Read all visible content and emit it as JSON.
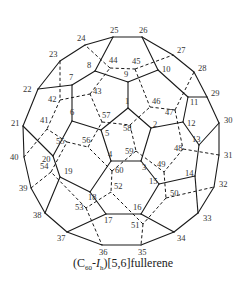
{
  "title": "(C60-Ih)[5,6]fullerene",
  "caption": {
    "prefix": "(C",
    "sub1": "60",
    "dash": "-",
    "italic": "I",
    "sub2": "h",
    "suffix": ")[5,6]fullerene"
  },
  "colors": {
    "stroke": "#1a1a1a",
    "label": "#333333",
    "background": "#ffffff"
  },
  "nodes": {
    "1": [
      128,
      108
    ],
    "2": [
      151,
      128
    ],
    "3": [
      141,
      161
    ],
    "4": [
      111,
      161
    ],
    "5": [
      101,
      130
    ],
    "6": [
      72,
      121
    ],
    "7": [
      72,
      85
    ],
    "8": [
      95,
      71
    ],
    "9": [
      128,
      82
    ],
    "10": [
      158,
      70
    ],
    "11": [
      188,
      97
    ],
    "12": [
      183,
      122
    ],
    "13": [
      199,
      145
    ],
    "14": [
      195,
      176
    ],
    "15": [
      159,
      184
    ],
    "16": [
      141,
      214
    ],
    "17": [
      106,
      214
    ],
    "18": [
      90,
      192
    ],
    "19": [
      60,
      177
    ],
    "20": [
      53,
      156
    ],
    "21": [
      23,
      126
    ],
    "22": [
      38,
      89
    ],
    "23": [
      60,
      61
    ],
    "24": [
      85,
      45
    ],
    "25": [
      113,
      37
    ],
    "26": [
      142,
      37
    ],
    "27": [
      173,
      55
    ],
    "28": [
      194,
      72
    ],
    "29": [
      207,
      97
    ],
    "30": [
      219,
      123
    ],
    "31": [
      219,
      155
    ],
    "32": [
      214,
      187
    ],
    "33": [
      198,
      213
    ],
    "34": [
      174,
      232
    ],
    "35": [
      141,
      245
    ],
    "36": [
      102,
      245
    ],
    "37": [
      67,
      232
    ],
    "38": [
      45,
      213
    ],
    "39": [
      31,
      188
    ],
    "40": [
      24,
      157
    ],
    "41": [
      47,
      129
    ],
    "42": [
      60,
      100
    ],
    "43": [
      90,
      94
    ],
    "44": [
      110,
      68
    ],
    "45": [
      135,
      69
    ],
    "46": [
      150,
      107
    ],
    "47": [
      175,
      110
    ],
    "48": [
      183,
      149
    ],
    "49": [
      164,
      172
    ],
    "50": [
      166,
      198
    ],
    "51": [
      143,
      224
    ],
    "52": [
      111,
      192
    ],
    "53": [
      86,
      208
    ],
    "54": [
      51,
      172
    ],
    "55": [
      67,
      142
    ],
    "56": [
      88,
      147
    ],
    "57": [
      102,
      122
    ],
    "58": [
      130,
      125
    ],
    "59": [
      136,
      151
    ],
    "60": [
      112,
      171
    ]
  },
  "label_offsets": {
    "1": [
      -3,
      -4
    ],
    "2": [
      2,
      -1
    ],
    "3": [
      1,
      9
    ],
    "4": [
      -3,
      -4
    ],
    "5": [
      4,
      6
    ],
    "6": [
      -2,
      -6
    ],
    "7": [
      -3,
      -5
    ],
    "8": [
      -8,
      -3
    ],
    "9": [
      -4,
      -5
    ],
    "10": [
      4,
      2
    ],
    "11": [
      2,
      8
    ],
    "12": [
      4,
      4
    ],
    "13": [
      -7,
      -3
    ],
    "14": [
      -10,
      0
    ],
    "15": [
      -10,
      0
    ],
    "16": [
      -8,
      -4
    ],
    "17": [
      -2,
      9
    ],
    "18": [
      -2,
      8
    ],
    "19": [
      4,
      -3
    ],
    "20": [
      -11,
      6
    ],
    "21": [
      -12,
      0
    ],
    "22": [
      -15,
      3
    ],
    "23": [
      -11,
      -4
    ],
    "24": [
      -8,
      -4
    ],
    "25": [
      -3,
      -4
    ],
    "26": [
      -3,
      -4
    ],
    "27": [
      4,
      -2
    ],
    "28": [
      4,
      -1
    ],
    "29": [
      4,
      -1
    ],
    "30": [
      5,
      0
    ],
    "31": [
      5,
      3
    ],
    "32": [
      5,
      0
    ],
    "33": [
      5,
      8
    ],
    "34": [
      3,
      9
    ],
    "35": [
      -3,
      10
    ],
    "36": [
      -3,
      10
    ],
    "37": [
      -10,
      9
    ],
    "38": [
      -12,
      5
    ],
    "39": [
      -12,
      3
    ],
    "40": [
      -14,
      3
    ],
    "41": [
      -7,
      -6
    ],
    "42": [
      -12,
      2
    ],
    "43": [
      3,
      0
    ],
    "44": [
      -1,
      -5
    ],
    "45": [
      -3,
      -5
    ],
    "46": [
      2,
      -3
    ],
    "47": [
      -10,
      5
    ],
    "48": [
      -9,
      2
    ],
    "49": [
      -7,
      -5
    ],
    "50": [
      4,
      -2
    ],
    "51": [
      -12,
      4
    ],
    "52": [
      3,
      -3
    ],
    "53": [
      -11,
      2
    ],
    "54": [
      -11,
      -3
    ],
    "55": [
      -11,
      2
    ],
    "56": [
      -6,
      -4
    ],
    "57": [
      0,
      -4
    ],
    "58": [
      -7,
      6
    ],
    "59": [
      -11,
      3
    ],
    "60": [
      3,
      2
    ]
  },
  "solid_edges": [
    [
      21,
      22
    ],
    [
      22,
      23
    ],
    [
      23,
      24
    ],
    [
      24,
      25
    ],
    [
      25,
      26
    ],
    [
      26,
      27
    ],
    [
      27,
      28
    ],
    [
      28,
      29
    ],
    [
      29,
      30
    ],
    [
      30,
      31
    ],
    [
      31,
      32
    ],
    [
      32,
      33
    ],
    [
      33,
      34
    ],
    [
      34,
      35
    ],
    [
      35,
      36
    ],
    [
      36,
      37
    ],
    [
      37,
      38
    ],
    [
      38,
      39
    ],
    [
      39,
      40
    ],
    [
      40,
      21
    ],
    [
      22,
      7
    ],
    [
      7,
      8
    ],
    [
      8,
      25
    ],
    [
      8,
      9
    ],
    [
      9,
      10
    ],
    [
      10,
      26
    ],
    [
      10,
      11
    ],
    [
      11,
      29
    ],
    [
      11,
      12
    ],
    [
      12,
      13
    ],
    [
      13,
      30
    ],
    [
      13,
      14
    ],
    [
      14,
      33
    ],
    [
      14,
      15
    ],
    [
      15,
      16
    ],
    [
      16,
      34
    ],
    [
      16,
      17
    ],
    [
      17,
      37
    ],
    [
      17,
      18
    ],
    [
      18,
      19
    ],
    [
      19,
      38
    ],
    [
      19,
      20
    ],
    [
      20,
      21
    ],
    [
      20,
      6
    ],
    [
      6,
      7
    ],
    [
      1,
      2
    ],
    [
      2,
      3
    ],
    [
      3,
      4
    ],
    [
      4,
      5
    ],
    [
      5,
      1
    ],
    [
      1,
      9
    ],
    [
      2,
      12
    ],
    [
      3,
      15
    ],
    [
      4,
      18
    ],
    [
      5,
      6
    ]
  ],
  "dashed_edges": [
    [
      23,
      42
    ],
    [
      42,
      41
    ],
    [
      41,
      40
    ],
    [
      42,
      43
    ],
    [
      43,
      44
    ],
    [
      44,
      24
    ],
    [
      44,
      45
    ],
    [
      45,
      27
    ],
    [
      45,
      46
    ],
    [
      46,
      47
    ],
    [
      47,
      28
    ],
    [
      47,
      48
    ],
    [
      48,
      31
    ],
    [
      48,
      49
    ],
    [
      49,
      50
    ],
    [
      50,
      32
    ],
    [
      50,
      51
    ],
    [
      51,
      35
    ],
    [
      51,
      52
    ],
    [
      52,
      53
    ],
    [
      53,
      36
    ],
    [
      53,
      54
    ],
    [
      54,
      39
    ],
    [
      54,
      55
    ],
    [
      55,
      41
    ],
    [
      55,
      56
    ],
    [
      56,
      57
    ],
    [
      57,
      43
    ],
    [
      57,
      58
    ],
    [
      58,
      46
    ],
    [
      58,
      59
    ],
    [
      59,
      49
    ],
    [
      59,
      60
    ],
    [
      60,
      52
    ],
    [
      60,
      56
    ]
  ]
}
